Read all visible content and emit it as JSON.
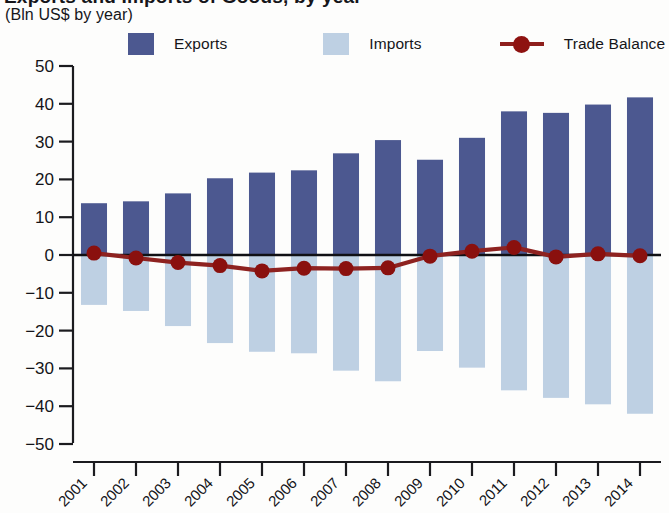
{
  "header": {
    "title_fragment": "Exports and Imports of Goods, by year",
    "subtitle": "(Bln US$ by year)"
  },
  "legend": {
    "position": "top",
    "items": [
      {
        "label": "Exports",
        "color": "#4c5890",
        "marker": "square-swatch"
      },
      {
        "label": "Imports",
        "color": "#bed0e3",
        "marker": "square-swatch"
      },
      {
        "label": "Trade Balance",
        "color": "#8e1210",
        "marker": "line-with-circle"
      }
    ]
  },
  "axes": {
    "y_ticks": [
      "50",
      "40",
      "30",
      "20",
      "10",
      "0",
      "-10",
      "-20",
      "-30",
      "-40",
      "-50"
    ],
    "x_ticks": [
      "2001",
      "2002",
      "2003",
      "2004",
      "2005",
      "2006",
      "2007",
      "2008",
      "2009",
      "2010",
      "2011",
      "2012",
      "2013",
      "2014"
    ]
  },
  "chart_data": {
    "type": "bar",
    "title": "Exports and Imports of Goods, by year",
    "subtitle": "(Bln US$ by year)",
    "xlabel": "",
    "ylabel": "",
    "ylim": [
      -50,
      50
    ],
    "ytick_step": 10,
    "grid": false,
    "legend_position": "top",
    "categories": [
      "2001",
      "2002",
      "2003",
      "2004",
      "2005",
      "2006",
      "2007",
      "2008",
      "2009",
      "2010",
      "2011",
      "2012",
      "2013",
      "2014"
    ],
    "series": [
      {
        "name": "Exports",
        "type": "bar",
        "color": "#4c5890",
        "values": [
          13.7,
          14.2,
          16.3,
          20.3,
          21.8,
          22.4,
          26.9,
          30.4,
          25.2,
          31.0,
          38.0,
          37.6,
          39.8,
          41.7
        ]
      },
      {
        "name": "Imports",
        "type": "bar",
        "color": "#bed0e3",
        "note": "plotted as negative values below the zero line",
        "values": [
          -13.2,
          -14.8,
          -18.8,
          -23.3,
          -25.6,
          -26.0,
          -30.6,
          -33.4,
          -25.4,
          -29.8,
          -35.8,
          -37.8,
          -39.5,
          -42.0
        ]
      },
      {
        "name": "Trade Balance",
        "type": "line",
        "color": "#8e1210",
        "values": [
          0.5,
          -0.8,
          -2.0,
          -2.8,
          -4.2,
          -3.5,
          -3.6,
          -3.4,
          -0.3,
          1.0,
          2.0,
          -0.5,
          0.3,
          -0.2
        ]
      }
    ]
  }
}
